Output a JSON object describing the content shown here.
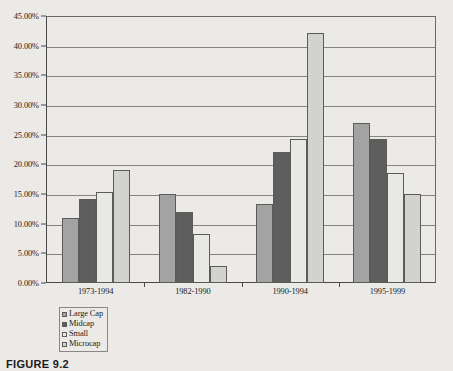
{
  "caption": "FIGURE 9.2",
  "chart_data": {
    "type": "bar",
    "title": "",
    "xlabel": "",
    "ylabel": "",
    "ylim": [
      0,
      45
    ],
    "ytick_labels": [
      "0.00%",
      "5.00%",
      "10.00%",
      "15.00%",
      "20.00%",
      "25.00%",
      "30.00%",
      "35.00%",
      "40.00%",
      "45.00%"
    ],
    "ytick_values": [
      0,
      5,
      10,
      15,
      20,
      25,
      30,
      35,
      40,
      45
    ],
    "grid": true,
    "legend_position": "bottom-left",
    "categories": [
      "1973-1994",
      "1982-1990",
      "1990-1994",
      "1995-1999"
    ],
    "series": [
      {
        "name": "Large Cap",
        "color": "#a3a3a3",
        "values": [
          11.0,
          15.0,
          13.3,
          27.0
        ]
      },
      {
        "name": "Midcap",
        "color": "#5e5e5e",
        "values": [
          14.1,
          12.0,
          22.0,
          24.3
        ]
      },
      {
        "name": "Small",
        "color": "#e8e8e6",
        "values": [
          15.3,
          8.3,
          24.3,
          18.5
        ]
      },
      {
        "name": "Microcap",
        "color": "#d2d2d0",
        "values": [
          19.0,
          2.8,
          42.2,
          15.0
        ]
      }
    ]
  }
}
